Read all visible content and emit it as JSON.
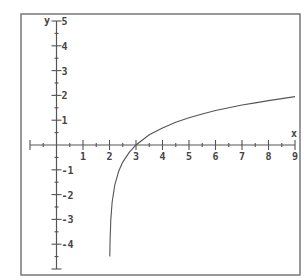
{
  "chart_data": {
    "type": "line",
    "title": "",
    "xlabel": "x",
    "ylabel": "y",
    "function": "y = ln(x - 2)",
    "xlim": [
      -1,
      9
    ],
    "ylim": [
      -5,
      5
    ],
    "grid": false,
    "legend": null,
    "x_ticks": [
      1,
      2,
      3,
      4,
      5,
      6,
      7,
      8,
      9
    ],
    "x_tick_labels": [
      "1",
      "2",
      "3",
      "4",
      "5",
      "6",
      "7",
      "8",
      "9"
    ],
    "y_ticks": [
      5,
      4,
      3,
      2,
      1,
      -1,
      -2,
      -3,
      -4
    ],
    "y_tick_labels": [
      "5",
      "4",
      "3",
      "2",
      "1",
      "-1",
      "-2",
      "-3",
      "-4"
    ],
    "minor_tick_step": 0.5,
    "series": [
      {
        "name": "ln(x-2)",
        "x": [
          2.011,
          2.02,
          2.05,
          2.1,
          2.2,
          2.35,
          2.5,
          2.75,
          3,
          3.5,
          4,
          4.5,
          5,
          5.5,
          6,
          6.5,
          7,
          7.5,
          8,
          8.5,
          9
        ],
        "y": [
          -4.5,
          -3.91,
          -3.0,
          -2.3,
          -1.61,
          -1.05,
          -0.69,
          -0.29,
          0.0,
          0.41,
          0.69,
          0.92,
          1.1,
          1.25,
          1.39,
          1.5,
          1.61,
          1.7,
          1.79,
          1.87,
          1.95
        ]
      }
    ],
    "annotations": [
      {
        "text": "x",
        "position": "right end of x-axis"
      },
      {
        "text": "y",
        "position": "top of y-axis"
      }
    ]
  },
  "axes": {
    "x_label": "x",
    "y_label": "y"
  },
  "colors": {
    "frame": "#6e6e6e",
    "axis": "#555555",
    "curve": "#555555",
    "text": "#444444",
    "background": "#ffffff"
  }
}
